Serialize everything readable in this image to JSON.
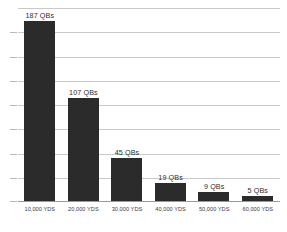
{
  "chart_data": {
    "type": "bar",
    "title": "",
    "subtitle": "",
    "xlabel": "",
    "ylabel": "",
    "categories": [
      "10,000 YDS",
      "20,000 YDS",
      "30,000 YDS",
      "40,000 YDS",
      "50,000 YDS",
      "60,000 YDS"
    ],
    "values": [
      187,
      107,
      45,
      19,
      9,
      5
    ],
    "data_labels": [
      "187 QBs",
      "107 QBs",
      "45 QBs",
      "19 QBs",
      "9 QBs",
      "5 QBs"
    ],
    "ylim": [
      0,
      200
    ],
    "y_tick_step": 25,
    "y_ticks": [
      0,
      25,
      50,
      75,
      100,
      125,
      150,
      175,
      200
    ],
    "y_tick_labels_visible": false,
    "grid": true,
    "grid_axis": "y",
    "legend": false,
    "legend_position": "none",
    "bar_color": "#2b2b2b",
    "grid_color": "#c9c9c9",
    "axis_color": "#9a9a9a",
    "background_color": "#ffffff",
    "label_color": "#2e2e2e",
    "series": [
      {
        "name": "QBs",
        "values": [
          187,
          107,
          45,
          19,
          9,
          5
        ]
      }
    ]
  }
}
